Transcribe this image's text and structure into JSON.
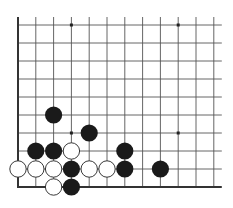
{
  "diagram": {
    "type": "go-board-corner",
    "grid": {
      "columns": 12,
      "rows": 10,
      "origin_x": 18,
      "origin_y": 25,
      "spacing_x": 17.8,
      "spacing_y": 18,
      "line_color": "#555555",
      "edge_color": "#333333",
      "open_right_extension": 8,
      "open_top_extension": 8
    },
    "edges": [
      "left",
      "bottom"
    ],
    "star_points": [
      {
        "col": 3,
        "row": 0
      },
      {
        "col": 9,
        "row": 0
      },
      {
        "col": 3,
        "row": 6
      },
      {
        "col": 9,
        "row": 6
      }
    ],
    "stones": [
      {
        "color": "black",
        "col": 2,
        "row": 5
      },
      {
        "color": "black",
        "col": 4,
        "row": 6
      },
      {
        "color": "black",
        "col": 1,
        "row": 7
      },
      {
        "color": "black",
        "col": 2,
        "row": 7
      },
      {
        "color": "white",
        "col": 3,
        "row": 7
      },
      {
        "color": "black",
        "col": 6,
        "row": 7
      },
      {
        "color": "white",
        "col": 0,
        "row": 8
      },
      {
        "color": "white",
        "col": 1,
        "row": 8
      },
      {
        "color": "white",
        "col": 2,
        "row": 8
      },
      {
        "color": "black",
        "col": 3,
        "row": 8
      },
      {
        "color": "white",
        "col": 4,
        "row": 8
      },
      {
        "color": "white",
        "col": 5,
        "row": 8
      },
      {
        "color": "black",
        "col": 6,
        "row": 8
      },
      {
        "color": "black",
        "col": 8,
        "row": 8
      },
      {
        "color": "white",
        "col": 2,
        "row": 9
      },
      {
        "color": "black",
        "col": 3,
        "row": 9
      }
    ],
    "colors": {
      "black_stone": "#1a1a1a",
      "white_stone": "#ffffff",
      "white_stone_border": "#222222",
      "background": "#ffffff"
    }
  }
}
